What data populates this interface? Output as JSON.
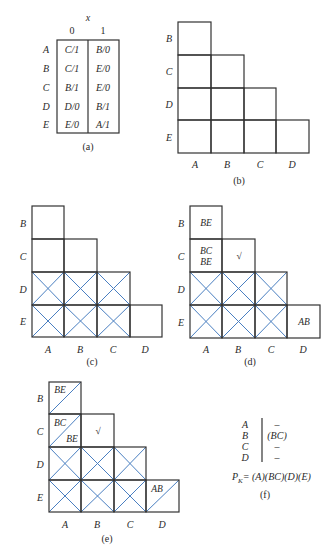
{
  "colors": {
    "line": "#333333",
    "blue": "#4a7fc1",
    "text": "#2a2a2a"
  },
  "panel_a": {
    "caption": "(a)",
    "input_label": "x",
    "columns": [
      "0",
      "1"
    ],
    "rows": [
      {
        "state": "A",
        "x0": "C/1",
        "x1": "B/0"
      },
      {
        "state": "B",
        "x0": "C/1",
        "x1": "E/0"
      },
      {
        "state": "C",
        "x0": "B/1",
        "x1": "E/0"
      },
      {
        "state": "D",
        "x0": "D/0",
        "x1": "B/1"
      },
      {
        "state": "E",
        "x0": "E/0",
        "x1": "A/1"
      }
    ]
  },
  "implication_chart": {
    "row_labels": [
      "B",
      "C",
      "D",
      "E"
    ],
    "col_labels": [
      "A",
      "B",
      "C",
      "D"
    ]
  },
  "panel_b": {
    "caption": "(b)"
  },
  "panel_c": {
    "caption": "(c)",
    "crossed_cells": [
      "DA",
      "DB",
      "DC",
      "EA",
      "EB",
      "EC"
    ]
  },
  "panel_d": {
    "caption": "(d)",
    "cells": {
      "BA": "BE",
      "CA_1": "BC",
      "CA_2": "BE",
      "CB": "√",
      "ED": "AB"
    }
  },
  "panel_e": {
    "caption": "(e)",
    "cells": {
      "BA": "BE",
      "CA_1": "BC",
      "CA_2": "BE",
      "CB": "√",
      "ED": "AB"
    },
    "slashed_cells": [
      "BA",
      "CA",
      "ED"
    ]
  },
  "panel_f": {
    "caption": "(f)",
    "rows": [
      {
        "state": "A",
        "value": "–"
      },
      {
        "state": "B",
        "value": "(BC)"
      },
      {
        "state": "C",
        "value": "–"
      },
      {
        "state": "D",
        "value": "–"
      }
    ],
    "formula_lhs": "P",
    "formula_sub": "K",
    "formula_rhs": "= (A)(BC)(D)(E)"
  }
}
